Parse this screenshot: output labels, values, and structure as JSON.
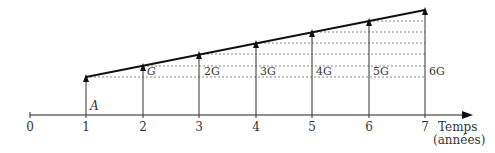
{
  "diagram": {
    "title": "",
    "axis": {
      "label_line1": "Temps",
      "label_line2": "(années)",
      "ticks": [
        "0",
        "1",
        "2",
        "3",
        "4",
        "5",
        "6",
        "7"
      ]
    },
    "base_label": "A",
    "gradient_labels": [
      "G",
      "2G",
      "3G",
      "4G",
      "5G",
      "6G"
    ],
    "colors": {
      "line": "#222222",
      "dashed": "#555555",
      "text": "#333333"
    }
  }
}
